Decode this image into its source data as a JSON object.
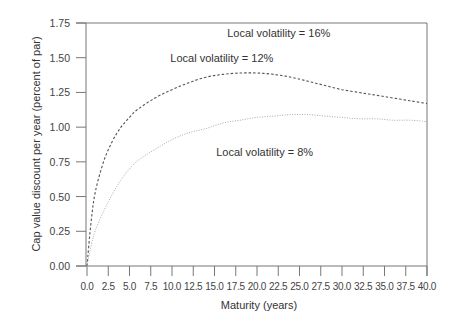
{
  "chart_data": {
    "type": "line",
    "title": "",
    "xlabel": "Maturity (years)",
    "ylabel": "Cap value discount per year (percent of par)",
    "xlim": [
      0,
      40
    ],
    "ylim": [
      0,
      1.75
    ],
    "grid": false,
    "legend_position": "none (inline annotations)",
    "x_ticks": [
      "0.0",
      "2.5",
      "5.0",
      "7.5",
      "10.0",
      "12.5",
      "15.0",
      "17.5",
      "20.0",
      "22.5",
      "25.0",
      "27.5",
      "30.0",
      "32.5",
      "35.0",
      "37.5",
      "40.0"
    ],
    "y_ticks": [
      "0.00",
      "0.25",
      "0.50",
      "0.75",
      "1.00",
      "1.25",
      "1.50",
      "1.75"
    ],
    "series": [
      {
        "name": "Local volatility = 12%",
        "style": "dashed",
        "color": "#555555",
        "x": [
          0,
          0.5,
          1,
          2,
          3,
          4,
          5,
          6,
          8,
          10,
          12,
          14,
          16,
          18,
          20,
          22,
          24,
          26,
          28,
          30,
          32,
          34,
          36,
          38,
          40
        ],
        "values": [
          0,
          0.33,
          0.54,
          0.76,
          0.9,
          1.0,
          1.07,
          1.13,
          1.21,
          1.27,
          1.32,
          1.36,
          1.38,
          1.39,
          1.39,
          1.38,
          1.36,
          1.33,
          1.3,
          1.27,
          1.25,
          1.23,
          1.21,
          1.19,
          1.17
        ]
      },
      {
        "name": "Local volatility = 8%",
        "style": "dotted",
        "color": "#aaaaaa",
        "x": [
          0,
          0.5,
          1,
          2,
          3,
          4,
          5,
          6,
          8,
          10,
          12,
          14,
          16,
          18,
          20,
          22,
          24,
          26,
          28,
          30,
          32,
          34,
          36,
          38,
          40
        ],
        "values": [
          0,
          0.15,
          0.26,
          0.4,
          0.52,
          0.62,
          0.7,
          0.76,
          0.84,
          0.91,
          0.96,
          0.99,
          1.03,
          1.05,
          1.07,
          1.08,
          1.09,
          1.09,
          1.08,
          1.07,
          1.06,
          1.06,
          1.05,
          1.05,
          1.04
        ]
      }
    ],
    "annotations": [
      {
        "text": "Local volatility = 16%",
        "x": 16.5,
        "y": 1.65
      },
      {
        "text": "Local volatility = 12%",
        "x": 9.8,
        "y": 1.47
      },
      {
        "text": "Local volatility = 8%",
        "x": 15.2,
        "y": 0.79
      }
    ]
  }
}
